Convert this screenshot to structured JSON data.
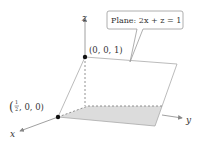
{
  "axes": {
    "x_label": "x",
    "y_label": "y",
    "z_label": "z"
  },
  "points": [
    {
      "label": "(0, 0, 1)"
    },
    {
      "label_open": "(",
      "frac_num": "1",
      "frac_den": "2",
      "label_rest": ", 0, 0)"
    }
  ],
  "callout": {
    "text": "Plane: 2x + z = 1"
  },
  "colors": {
    "plane_shade": "#d9d9d9",
    "axis": "#888888",
    "point": "#111111",
    "callout_border": "#9a9a9a"
  }
}
